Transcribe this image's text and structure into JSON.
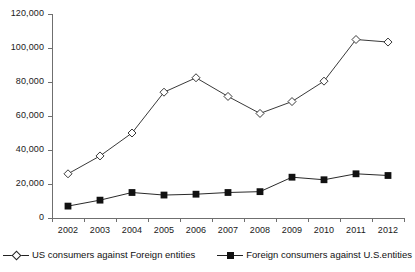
{
  "chart_data": {
    "type": "line",
    "title": "",
    "subtitle": "",
    "xlabel": "",
    "ylabel": "",
    "categories": [
      "2002",
      "2003",
      "2004",
      "2005",
      "2006",
      "2007",
      "2008",
      "2009",
      "2010",
      "2011",
      "2012"
    ],
    "ylim": [
      0,
      120000
    ],
    "y_ticks": [
      0,
      20000,
      40000,
      60000,
      80000,
      100000,
      120000
    ],
    "y_tick_labels": [
      "0",
      "20,000",
      "40,000",
      "60,000",
      "80,000",
      "100,000",
      "120,000"
    ],
    "grid": false,
    "legend_position": "bottom",
    "series": [
      {
        "name": "US consumers against Foreign entities",
        "marker": "open-diamond",
        "color": "#222222",
        "values": [
          26000,
          36500,
          50000,
          74000,
          82500,
          71500,
          61500,
          68500,
          80500,
          105000,
          103500
        ]
      },
      {
        "name": "Foreign consumers against U.S.entities",
        "marker": "filled-square",
        "color": "#111111",
        "values": [
          7000,
          10500,
          15000,
          13500,
          14000,
          15000,
          15500,
          24000,
          22500,
          26000,
          25000
        ]
      }
    ]
  },
  "legend": {
    "items": [
      {
        "label": "US consumers against Foreign entities",
        "marker": "open-diamond"
      },
      {
        "label": "Foreign consumers against U.S.entities",
        "marker": "filled-square"
      }
    ]
  }
}
